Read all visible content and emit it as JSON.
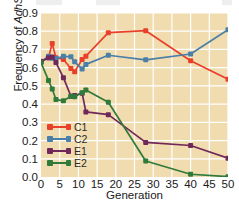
{
  "chart_data": {
    "type": "line",
    "title": "",
    "xlabel": "Generation",
    "ylabel": "Frequency of AdhS",
    "ylabel_plain": "Frequency of ",
    "ylabel_italic": "AdhS",
    "xlim": [
      0,
      50
    ],
    "ylim": [
      0.0,
      0.9
    ],
    "ytick_labels": [
      "0.9",
      "0.8",
      "0.7",
      "0.6",
      "0.5",
      "0.4",
      "0.3",
      "0.2",
      "0.1",
      "0.0"
    ],
    "ytick_values": [
      0.9,
      0.8,
      0.7,
      0.6,
      0.5,
      0.4,
      0.3,
      0.2,
      0.1,
      0.0
    ],
    "xtick_labels": [
      "0",
      "5",
      "10",
      "15",
      "20",
      "25",
      "30",
      "35",
      "40",
      "45",
      "50"
    ],
    "xtick_values": [
      0,
      5,
      10,
      15,
      20,
      25,
      30,
      35,
      40,
      45,
      50
    ],
    "grid": true,
    "grid_color": "#ffffff",
    "plot_background": "#f0dcae",
    "legend_position": "bottom-left",
    "legend_entries": [
      "C1",
      "C2",
      "E1",
      "E2"
    ],
    "series": [
      {
        "name": "C1",
        "color": "#e8402a",
        "x": [
          0,
          2,
          3,
          4,
          6,
          8,
          9,
          11,
          12,
          18,
          28,
          40,
          50
        ],
        "values": [
          0.635,
          0.655,
          0.733,
          0.655,
          0.645,
          0.595,
          0.578,
          0.645,
          0.663,
          0.792,
          0.803,
          0.638,
          0.537
        ]
      },
      {
        "name": "C2",
        "color": "#4a7fa8",
        "x": [
          0,
          2,
          3,
          4,
          6,
          8,
          9,
          11,
          12,
          18,
          28,
          40,
          50
        ],
        "values": [
          0.632,
          0.663,
          0.652,
          0.65,
          0.662,
          0.66,
          0.632,
          0.592,
          0.618,
          0.668,
          0.643,
          0.675,
          0.808
        ]
      },
      {
        "name": "E1",
        "color": "#70275a",
        "x": [
          0,
          2,
          3,
          4,
          6,
          8,
          9,
          11,
          12,
          18,
          28,
          40,
          50
        ],
        "values": [
          0.632,
          0.655,
          0.658,
          0.628,
          0.545,
          0.443,
          0.447,
          0.46,
          0.357,
          0.342,
          0.19,
          0.173,
          0.103
        ]
      },
      {
        "name": "E2",
        "color": "#2f7a3a",
        "x": [
          0,
          2,
          3,
          4,
          6,
          8,
          9,
          11,
          12,
          18,
          28,
          40,
          50
        ],
        "values": [
          0.628,
          0.53,
          0.483,
          0.425,
          0.418,
          0.443,
          0.44,
          0.463,
          0.478,
          0.41,
          0.088,
          0.015,
          0.002
        ]
      }
    ]
  }
}
